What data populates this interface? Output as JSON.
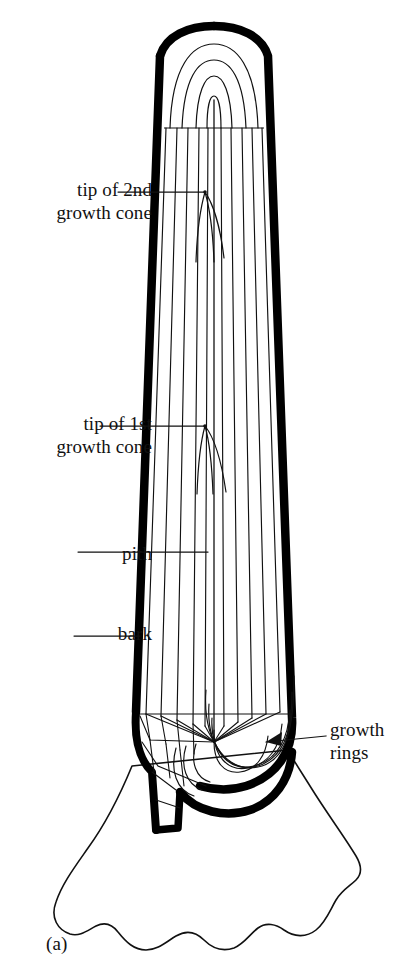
{
  "figure": {
    "caption": "(a)",
    "background_color": "#ffffff",
    "ink_color": "#111111",
    "bark_color": "#000000"
  },
  "labels": {
    "tip_of_2nd_growth_cone": {
      "line1": "tip of 2nd",
      "line2": "growth cone",
      "leader": "horizontal-line-to-right"
    },
    "tip_of_1st_growth_cone": {
      "line1": "tip of 1st",
      "line2": "growth cone",
      "leader": "horizontal-line-to-right"
    },
    "pith": {
      "line1": "pith",
      "leader": "horizontal-line-to-right"
    },
    "bark": {
      "line1": "bark",
      "leader": "short-line-to-right"
    },
    "growth_rings": {
      "line1": "growth",
      "line2": "rings",
      "leader": "arrow-to-left"
    }
  },
  "diagram_data": {
    "type": "diagram",
    "title": "Longitudinal section of a conifer trunk showing growth cones",
    "parts": [
      "bark",
      "pith",
      "growth rings",
      "tip of 1st growth cone",
      "tip of 2nd growth cone",
      "root flare"
    ],
    "growth_cone_tips_y": [
      192,
      426
    ],
    "vertical_ring_lines": 12,
    "base_ring_arcs": 9,
    "crown_arcs": 4
  }
}
